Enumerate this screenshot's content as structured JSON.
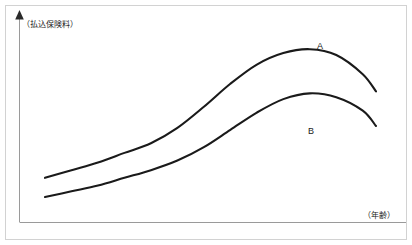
{
  "chart_data": {
    "type": "line",
    "title": "",
    "subtitle": "",
    "xlabel": "（年齢）",
    "ylabel": "（払込保険料）",
    "grid": false,
    "legend_position": "inline-right",
    "xlim": [
      0,
      100
    ],
    "ylim": [
      0,
      100
    ],
    "x_tick_labels": [],
    "y_tick_labels": [],
    "annotations": [],
    "series": [
      {
        "name": "A",
        "label": "A",
        "color": "#1a1a1a",
        "x": [
          0,
          8,
          16,
          24,
          32,
          40,
          48,
          56,
          64,
          72,
          80,
          88,
          96,
          100
        ],
        "values": [
          23,
          27,
          31,
          36,
          41,
          49,
          60,
          72,
          82,
          88,
          90,
          87,
          77,
          68
        ]
      },
      {
        "name": "B",
        "label": "B",
        "color": "#1a1a1a",
        "x": [
          0,
          8,
          16,
          24,
          32,
          40,
          48,
          56,
          64,
          72,
          80,
          88,
          96,
          100
        ],
        "values": [
          13,
          16,
          19,
          23,
          27,
          32,
          39,
          48,
          57,
          64,
          67,
          65,
          58,
          50
        ]
      }
    ]
  },
  "axes": {
    "y_axis_label": "（払込保険料）",
    "x_axis_label": "（年齢）",
    "y_axis_arrow": "up-arrow-icon",
    "axis_color": "#8c8c8c",
    "curve_color": "#1a1a1a",
    "border_color": "#cfcfcf"
  },
  "series_labels": {
    "a": "A",
    "b": "B"
  }
}
